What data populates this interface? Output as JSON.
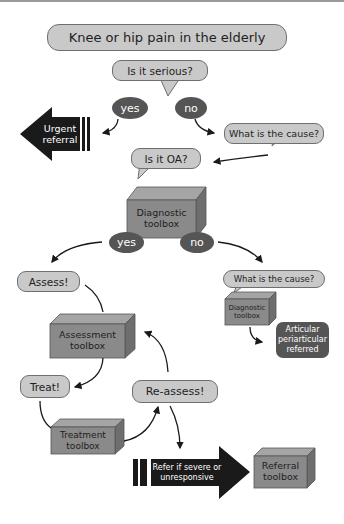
{
  "title": "Knee or hip pain in the elderly",
  "nodes": {
    "is_serious": "Is it serious?",
    "serious_yes": "yes",
    "serious_no": "no",
    "urgent_referral": "Urgent referral",
    "what_cause_1": "What is the cause?",
    "is_oa": "Is it OA?",
    "diagnostic_toolbox_1": "Diagnostic toolbox",
    "oa_yes": "yes",
    "oa_no": "no",
    "what_cause_2": "What is the cause?",
    "diagnostic_toolbox_2": "Diagnostic toolbox",
    "articular": "Articular periarticular referred",
    "assess": "Assess!",
    "assessment_toolbox": "Assessment toolbox",
    "treat": "Treat!",
    "reassess": "Re-assess!",
    "treatment_toolbox": "Treatment toolbox",
    "refer": "Refer if severe or unresponsive",
    "referral_toolbox": "Referral toolbox"
  },
  "colors": {
    "bubble_fill": "#c9c9c9",
    "box_fill": "#8a8a8a",
    "oval_fill": "#555555",
    "arrow_fill": "#1a1a1a"
  }
}
